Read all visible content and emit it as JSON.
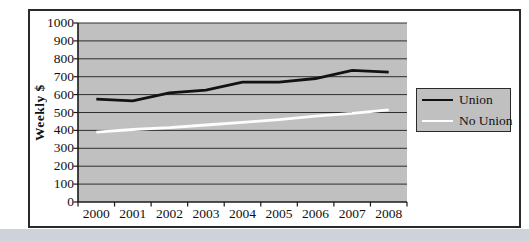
{
  "page": {
    "bottom_strip_color": "#cdd3d8",
    "frame_border_color": "#2a2a2a",
    "background_color": "#ffffff"
  },
  "chart": {
    "plot_bg_color": "#c0c0c0",
    "gridline_color": "#2e2e2e",
    "axis_color": "#1a1a1a",
    "y_axis": {
      "title": "Weekly $",
      "tick_labels": [
        "0",
        "100",
        "200",
        "300",
        "400",
        "500",
        "600",
        "700",
        "800",
        "900",
        "1000"
      ]
    },
    "x_axis": {
      "tick_labels": [
        "2000",
        "2001",
        "2002",
        "2003",
        "2004",
        "2005",
        "2006",
        "2007",
        "2008"
      ]
    }
  },
  "chart_data": {
    "type": "line",
    "title": "",
    "xlabel": "",
    "ylabel": "Weekly $",
    "categories": [
      "2000",
      "2001",
      "2002",
      "2003",
      "2004",
      "2005",
      "2006",
      "2007",
      "2008"
    ],
    "series": [
      {
        "name": "Union",
        "color": "#121212",
        "values": [
          575,
          565,
          610,
          625,
          670,
          670,
          690,
          735,
          725
        ]
      },
      {
        "name": "No Union",
        "color": "#fdfdfd",
        "values": [
          390,
          405,
          415,
          430,
          445,
          460,
          480,
          495,
          515
        ]
      }
    ],
    "ylim": [
      0,
      1000
    ],
    "ytick_step": 100,
    "grid": true,
    "legend_position": "right",
    "legend_entries": [
      "Union",
      "No Union"
    ]
  }
}
